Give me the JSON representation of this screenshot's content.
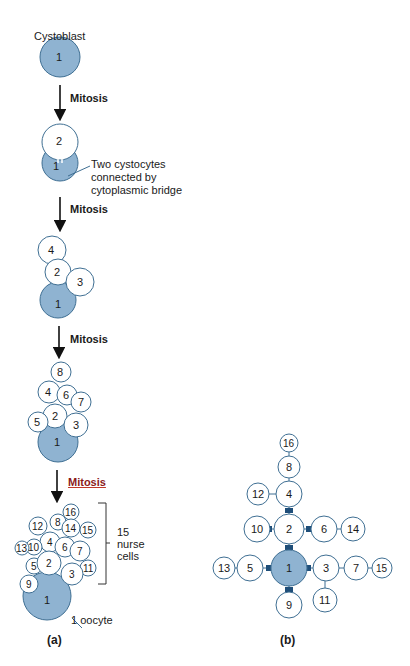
{
  "header_fragment": "",
  "panel_a": {
    "tag": "(a)",
    "cystoblast_label": "Cystoblast",
    "mitosis_label": "Mitosis",
    "bridge_annotation": [
      "Two cystocytes",
      "connected by",
      "cytoplasmic bridge"
    ],
    "nurse_bracket_label": [
      "15",
      "nurse",
      "cells"
    ],
    "oocyte_label": "1 oocyte",
    "stages": [
      {
        "cells": [
          1
        ]
      },
      {
        "cells": [
          1,
          2
        ]
      },
      {
        "cells": [
          1,
          2,
          3,
          4
        ]
      },
      {
        "cells": [
          1,
          2,
          3,
          4,
          5,
          6,
          7,
          8
        ]
      },
      {
        "cells": [
          1,
          2,
          3,
          4,
          5,
          6,
          7,
          8,
          9,
          10,
          11,
          12,
          13,
          14,
          15,
          16
        ]
      }
    ]
  },
  "panel_b": {
    "tag": "(b)",
    "cells": [
      "1",
      "2",
      "3",
      "4",
      "5",
      "6",
      "7",
      "8",
      "9",
      "10",
      "11",
      "12",
      "13",
      "14",
      "15",
      "16"
    ],
    "connections": [
      [
        "1",
        "2"
      ],
      [
        "1",
        "3"
      ],
      [
        "1",
        "5"
      ],
      [
        "1",
        "9"
      ],
      [
        "2",
        "4"
      ],
      [
        "2",
        "6"
      ],
      [
        "2",
        "10"
      ],
      [
        "3",
        "7"
      ],
      [
        "3",
        "11"
      ],
      [
        "4",
        "8"
      ],
      [
        "4",
        "12"
      ],
      [
        "5",
        "13"
      ],
      [
        "6",
        "14"
      ],
      [
        "7",
        "15"
      ],
      [
        "8",
        "16"
      ]
    ]
  },
  "colors": {
    "oocyte_fill": "#8fb3d1",
    "cell_stroke": "#3f6f93",
    "bridge_dark": "#1f4e79"
  }
}
